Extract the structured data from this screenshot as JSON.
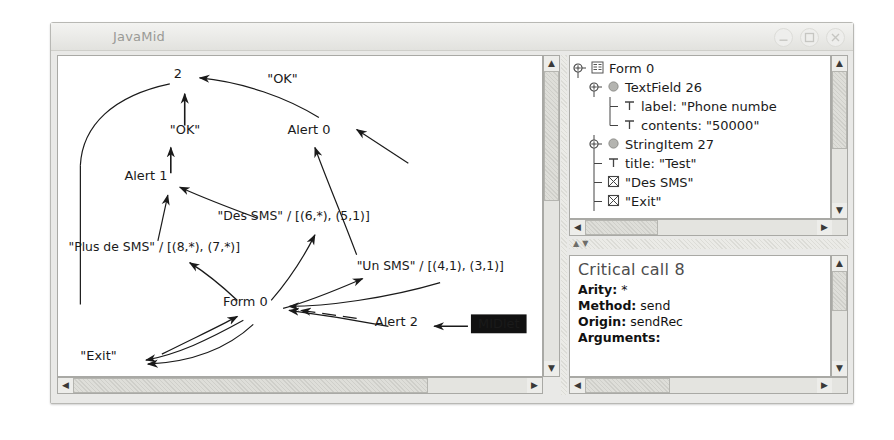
{
  "window": {
    "title": "JavaMid",
    "buttons": {
      "minimize": "minimize-button",
      "maximize": "maximize-button",
      "close": "close-button"
    }
  },
  "graph": {
    "nodes": [
      {
        "id": "n2",
        "label": "2",
        "x": 120,
        "y": 22
      },
      {
        "id": "alert0",
        "label": "Alert 0",
        "x": 252,
        "y": 78
      },
      {
        "id": "alert1",
        "label": "Alert 1",
        "x": 88,
        "y": 125
      },
      {
        "id": "form0",
        "label": "Form 0",
        "x": 188,
        "y": 252
      },
      {
        "id": "alert2",
        "label": "Alert 2",
        "x": 340,
        "y": 272
      },
      {
        "id": "midlet",
        "label": "MIDlet",
        "x": 420,
        "y": 272
      }
    ],
    "edge_labels": [
      {
        "id": "ok_top",
        "text": "\"OK\"",
        "x": 210,
        "y": 27
      },
      {
        "id": "ok_mid",
        "text": "\"OK\"",
        "x": 112,
        "y": 78
      },
      {
        "id": "des_sms",
        "text": "\"Des SMS\" / [(6,*), (5,1)]",
        "x": 160,
        "y": 165
      },
      {
        "id": "plus_sms",
        "text": "\"Plus de SMS\" / [(8,*), (7,*)]",
        "x": 10,
        "y": 196
      },
      {
        "id": "un_sms",
        "text": "\"Un SMS\" / [(4,1), (3,1)]",
        "x": 300,
        "y": 215
      },
      {
        "id": "exit",
        "text": "\"Exit\"",
        "x": 22,
        "y": 306
      }
    ],
    "highlighted_node": "MIDlet"
  },
  "tree": {
    "rows": [
      {
        "indent": 0,
        "handle": "expanded",
        "icon": "form-icon",
        "label": "Form 0"
      },
      {
        "indent": 1,
        "handle": "expanded",
        "icon": "item-icon",
        "label": "TextField 26"
      },
      {
        "indent": 2,
        "handle": "branch",
        "icon": "text-icon",
        "label": "label: \"Phone numbe"
      },
      {
        "indent": 2,
        "handle": "last",
        "icon": "text-icon",
        "label": "contents: \"50000\""
      },
      {
        "indent": 1,
        "handle": "expanded",
        "icon": "item-icon",
        "label": "StringItem 27"
      },
      {
        "indent": 1,
        "handle": "branch",
        "icon": "text-icon",
        "label": "title: \"Test\""
      },
      {
        "indent": 1,
        "handle": "branch",
        "icon": "command-icon",
        "label": "\"Des SMS\""
      },
      {
        "indent": 1,
        "handle": "branch",
        "icon": "command-icon",
        "label": "\"Exit\""
      }
    ]
  },
  "properties": {
    "title": "Critical call 8",
    "rows": [
      {
        "key": "Arity:",
        "value": "*"
      },
      {
        "key": "Method:",
        "value": "send"
      },
      {
        "key": "Origin:",
        "value": "sendRec"
      },
      {
        "key": "Arguments:",
        "value": ""
      }
    ]
  },
  "scrollbars": {
    "up": "▲",
    "down": "▼",
    "left": "◀",
    "right": "▶"
  },
  "splitter": {
    "collapse_up": "▲",
    "collapse_down": "▼"
  }
}
